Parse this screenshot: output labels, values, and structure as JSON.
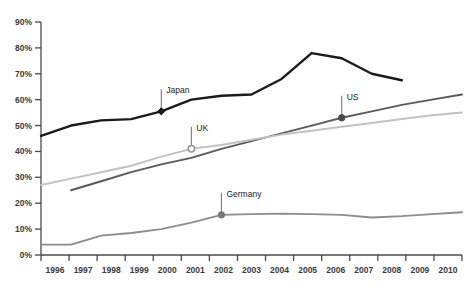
{
  "chart_data": {
    "type": "line",
    "title": "",
    "subtitle": "",
    "xlabel": "",
    "ylabel": "",
    "x": [
      1996,
      1997,
      1998,
      1999,
      2000,
      2001,
      2002,
      2003,
      2004,
      2005,
      2006,
      2007,
      2008,
      2009,
      2010
    ],
    "categories": [
      "1996",
      "1997",
      "1998",
      "1999",
      "2000",
      "2001",
      "2002",
      "2003",
      "2004",
      "2005",
      "2006",
      "2007",
      "2008",
      "2009",
      "2010"
    ],
    "xlim": [
      1996,
      2010
    ],
    "ylim": [
      0,
      90
    ],
    "ytick_values": [
      0,
      10,
      20,
      30,
      40,
      50,
      60,
      70,
      80,
      90
    ],
    "ytick_labels": [
      "0%",
      "10%",
      "20%",
      "30%",
      "40%",
      "50%",
      "60%",
      "70%",
      "80%",
      "90%"
    ],
    "grid": false,
    "legend": "none",
    "legend_position": "inline-annotations",
    "series": [
      {
        "name": "Japan",
        "color": "#1a1a1a",
        "width": 2.4,
        "x": [
          1996,
          1997,
          1998,
          1999,
          2000,
          2001,
          2002,
          2003,
          2004,
          2005,
          2006,
          2007,
          2008
        ],
        "values": [
          46,
          50,
          52,
          52.5,
          55.5,
          60,
          61.5,
          62,
          68,
          78,
          76,
          70,
          67.5
        ]
      },
      {
        "name": "US",
        "color": "#5a5a5a",
        "width": 1.9,
        "x": [
          1997,
          1998,
          1999,
          2000,
          2001,
          2002,
          2003,
          2004,
          2005,
          2006,
          2007,
          2008,
          2009,
          2010
        ],
        "values": [
          25,
          28.5,
          32,
          35,
          37.5,
          41,
          44,
          47,
          50,
          53,
          55.5,
          58,
          60,
          62
        ]
      },
      {
        "name": "UK",
        "color": "#c2c2c2",
        "width": 2.0,
        "x": [
          1996,
          1997,
          1998,
          1999,
          2000,
          2001,
          2002,
          2003,
          2004,
          2005,
          2006,
          2007,
          2008,
          2009,
          2010
        ],
        "values": [
          27,
          29.5,
          32,
          34.5,
          38,
          41,
          42.5,
          44.5,
          46.5,
          48,
          49.5,
          51,
          52.5,
          54,
          55
        ]
      },
      {
        "name": "Germany",
        "color": "#8c8c8c",
        "width": 1.9,
        "x": [
          1996,
          1997,
          1998,
          1999,
          2000,
          2001,
          2002,
          2003,
          2004,
          2005,
          2006,
          2007,
          2008,
          2009,
          2010
        ],
        "values": [
          4,
          4,
          7.5,
          8.5,
          10,
          12.5,
          15.5,
          15.8,
          16,
          15.8,
          15.5,
          14.5,
          15,
          15.8,
          16.5
        ]
      }
    ],
    "annotations": [
      {
        "label": "Japan",
        "x": 2000,
        "y": 55.5,
        "marker": "filled-diamond",
        "marker_color": "#1a1a1a",
        "leader_dy": 22,
        "label_dx": 5
      },
      {
        "label": "UK",
        "x": 2001,
        "y": 41,
        "marker": "open-circle",
        "marker_color": "#9a9a9a",
        "leader_dy": 22,
        "label_dx": 5
      },
      {
        "label": "US",
        "x": 2006,
        "y": 53,
        "marker": "filled-circle",
        "marker_color": "#4a4a4a",
        "leader_dy": 22,
        "label_dx": 5
      },
      {
        "label": "Germany",
        "x": 2002,
        "y": 15.5,
        "marker": "filled-circle",
        "marker_color": "#777777",
        "leader_dy": 22,
        "label_dx": 5
      }
    ]
  },
  "axis": {
    "axis_color": "#4a4a4a",
    "tick_color": "#4a4a4a",
    "label_color": "#3a3a3a"
  }
}
